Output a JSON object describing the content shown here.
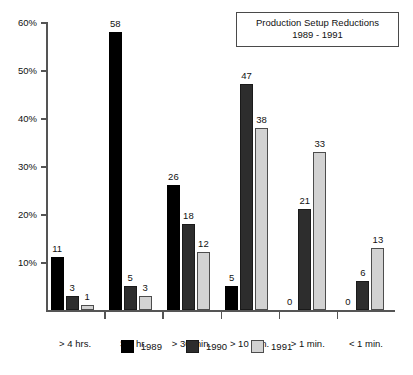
{
  "title": {
    "line1": "Production Setup Reductions",
    "line2": "1989 - 1991"
  },
  "legend": {
    "items": [
      {
        "label": "1989",
        "color": "#000000",
        "swatch": "legend-swatch-1989"
      },
      {
        "label": "1990",
        "color": "#2d2d2d",
        "swatch": "legend-swatch-1990"
      },
      {
        "label": "1991",
        "color": "#d2d2d2",
        "swatch": "legend-swatch-1991"
      }
    ]
  },
  "axis": {
    "y_ticks": [
      "60%",
      "50%",
      "40%",
      "30%",
      "20%",
      "10%"
    ]
  },
  "chart_data": {
    "type": "bar",
    "title": "Production Setup Reductions 1989 - 1991",
    "xlabel": "",
    "ylabel": "",
    "ylim": [
      0,
      60
    ],
    "ytick_values": [
      10,
      20,
      30,
      40,
      50,
      60
    ],
    "ytick_labels": [
      "10%",
      "20%",
      "30%",
      "40%",
      "50%",
      "60%"
    ],
    "grid": false,
    "legend_position": "bottom-center",
    "categories": [
      "> 4 hrs.",
      "> 1 hr.",
      "> 30 min.",
      "> 10 min.",
      "> 1 min.",
      "< 1 min."
    ],
    "series": [
      {
        "name": "1989",
        "color": "#000000",
        "values": [
          11,
          58,
          26,
          5,
          0,
          0
        ]
      },
      {
        "name": "1990",
        "color": "#2d2d2d",
        "values": [
          3,
          5,
          18,
          47,
          21,
          6
        ]
      },
      {
        "name": "1991",
        "color": "#d2d2d2",
        "values": [
          1,
          3,
          12,
          38,
          33,
          13
        ]
      }
    ],
    "value_labels": [
      [
        "11",
        "3",
        "1"
      ],
      [
        "58",
        "5",
        "3"
      ],
      [
        "26",
        "18",
        "12"
      ],
      [
        "5",
        "47",
        "38"
      ],
      [
        "0",
        "21",
        "33"
      ],
      [
        "0",
        "6",
        "13"
      ]
    ]
  }
}
